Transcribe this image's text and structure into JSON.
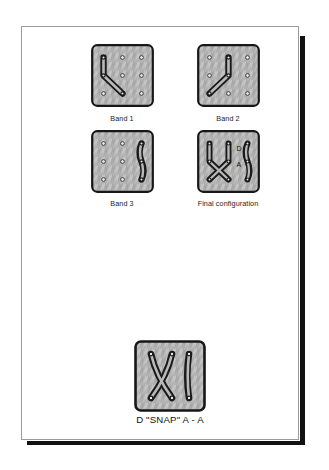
{
  "page": {
    "background_color": "#ffffff",
    "sheet_border_color": "#9a9a9a",
    "shadow_color": "#111111"
  },
  "style": {
    "board_fill": "#b4b4b4",
    "board_edge": "#1a1a1a",
    "band_color": "#1a1a1a",
    "peg_ring": "#3a3a3a",
    "peg_center": "#e8e8e8",
    "label_color": "#111111"
  },
  "figures": [
    {
      "id": "band-1",
      "caption": "Band 1",
      "description": "rubber band stretched from top-left peg down to middle-left peg then to bottom-centre peg",
      "pegs": [
        [
          0,
          0
        ],
        [
          1,
          0
        ],
        [
          2,
          0
        ],
        [
          0,
          1
        ],
        [
          1,
          1
        ],
        [
          2,
          1
        ],
        [
          0,
          2
        ],
        [
          1,
          2
        ],
        [
          2,
          2
        ]
      ],
      "band_path": [
        [
          0,
          0
        ],
        [
          0,
          1
        ],
        [
          1,
          2
        ]
      ],
      "labels": []
    },
    {
      "id": "band-2",
      "caption": "Band 2",
      "description": "rubber band stretched from top-centre peg down to middle-centre peg then to bottom-left peg",
      "pegs": [
        [
          0,
          0
        ],
        [
          1,
          0
        ],
        [
          2,
          0
        ],
        [
          0,
          1
        ],
        [
          1,
          1
        ],
        [
          2,
          1
        ],
        [
          0,
          2
        ],
        [
          1,
          2
        ],
        [
          2,
          2
        ]
      ],
      "band_path": [
        [
          1,
          0
        ],
        [
          1,
          1
        ],
        [
          0,
          2
        ]
      ],
      "labels": []
    },
    {
      "id": "band-3",
      "caption": "Band 3",
      "description": "rubber band stretched vertically on the right column from top-right peg through middle-right peg to bottom-right peg",
      "pegs": [
        [
          0,
          0
        ],
        [
          1,
          0
        ],
        [
          2,
          0
        ],
        [
          0,
          1
        ],
        [
          1,
          1
        ],
        [
          2,
          1
        ],
        [
          0,
          2
        ],
        [
          1,
          2
        ],
        [
          2,
          2
        ]
      ],
      "band_path": [
        [
          2,
          0
        ],
        [
          2,
          1
        ],
        [
          2,
          2
        ]
      ],
      "labels": []
    },
    {
      "id": "final-configuration",
      "caption": "Final configuration",
      "description": "all three bands together on one board forming a crossed X on the left and a vertical band on the right",
      "pegs": [
        [
          0,
          0
        ],
        [
          1,
          0
        ],
        [
          2,
          0
        ],
        [
          0,
          1
        ],
        [
          1,
          1
        ],
        [
          2,
          1
        ],
        [
          0,
          2
        ],
        [
          1,
          2
        ],
        [
          2,
          2
        ]
      ],
      "band_path": null,
      "labels": [
        {
          "text": "D",
          "x": 1.62,
          "y": 0.42
        },
        {
          "text": "A",
          "x": 1.62,
          "y": 1.28
        }
      ]
    }
  ],
  "bottom_figure": {
    "id": "snap-result",
    "caption": "D \"SNAP\" A - A",
    "description": "result board showing an X formed by two crossed bands plus a single vertical band at the right"
  }
}
